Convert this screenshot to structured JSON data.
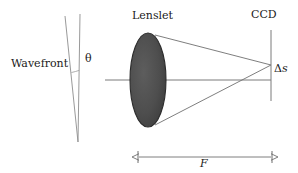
{
  "figure": {
    "type": "optical-ray-diagram",
    "width": 298,
    "height": 173,
    "background_color": "#ffffff",
    "line_color": "#6f6f6f",
    "lens_fill_color": "#4f4f4f",
    "lens_stroke_color": "#2b2b2b",
    "text_color": "#1a1a1a"
  },
  "labels": {
    "wavefront": "Wavefront",
    "theta": "θ",
    "lenslet": "Lenslet",
    "ccd": "CCD",
    "delta_symbol": "Δ",
    "delta_s_variable": "s",
    "focal_length": "F"
  },
  "elements": {
    "wavefront": {
      "name": "tilted wavefront rays",
      "reference_line": {
        "x1": 80,
        "y1": 14,
        "x2": 78,
        "y2": 142
      },
      "tilted_line": {
        "x1": 65,
        "y1": 16,
        "x2": 78,
        "y2": 142
      },
      "angle_arc_center": {
        "x": 78,
        "y": 142
      },
      "angle_arc_radius": 76
    },
    "lenslet": {
      "name": "converging lenslet",
      "center_x": 148,
      "center_y": 80,
      "radius_x": 18,
      "radius_y": 47
    },
    "optical_axis": {
      "x1": 105,
      "y1": 80,
      "x2": 271,
      "y2": 80
    },
    "rays": [
      {
        "name": "upper-marginal-ray",
        "x1": 155,
        "y1": 35,
        "x2": 271,
        "y2": 65
      },
      {
        "name": "lower-marginal-ray",
        "x1": 155,
        "y1": 125,
        "x2": 271,
        "y2": 65
      }
    ],
    "ccd_plane": {
      "x": 271,
      "y1": 30,
      "y2": 101
    },
    "focal_spot": {
      "x": 271,
      "y": 65
    },
    "delta_s_offset": {
      "from_y": 65,
      "to_y": 80
    },
    "focal_length_dimension": {
      "x1": 138,
      "x2": 272,
      "y": 157,
      "tick_half_height": 6
    }
  }
}
